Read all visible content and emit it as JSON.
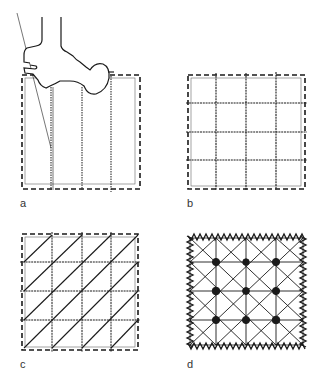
{
  "figure": {
    "panels": [
      {
        "id": "a",
        "label": "a",
        "description": "Presser foot stitching vertical lines inside basted square",
        "box": {
          "x": 22,
          "y": 75,
          "w": 118,
          "h": 114
        },
        "verticals": [
          51,
          82,
          111
        ]
      },
      {
        "id": "b",
        "label": "b",
        "description": "Square grid of vertical and horizontal stitch lines",
        "box": {
          "x": 188,
          "y": 75,
          "w": 117,
          "h": 114
        },
        "verticals": [
          216,
          246,
          276
        ],
        "horizontals": [
          103,
          132,
          160
        ]
      },
      {
        "id": "c",
        "label": "c",
        "description": "Grid with diagonal lines (bottom-left to top-right)",
        "box": {
          "x": 22,
          "y": 234,
          "w": 116,
          "h": 116
        },
        "verticals": [
          52,
          82,
          111
        ],
        "horizontals": [
          262,
          291,
          320
        ]
      },
      {
        "id": "d",
        "label": "d",
        "description": "Grid with both diagonals, zigzag border and knots at intersections",
        "box": {
          "x": 187,
          "y": 235,
          "w": 119,
          "h": 113
        },
        "verticals": [
          216,
          246,
          276
        ],
        "horizontals": [
          262,
          291,
          320
        ],
        "knots": 9
      }
    ]
  },
  "colors": {
    "ink": "#1a1a1a",
    "light": "#555555",
    "bg": "#ffffff"
  }
}
